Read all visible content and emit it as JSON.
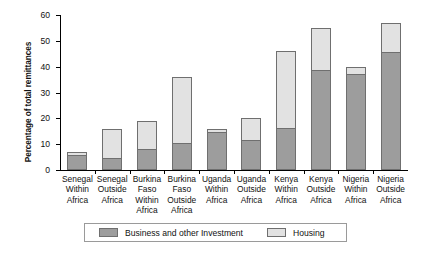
{
  "chart_data": {
    "type": "bar",
    "subtype": "stacked-bar",
    "title": "",
    "xlabel": "",
    "ylabel": "Percentage of total remittances",
    "ylim": [
      0,
      60
    ],
    "yticks": [
      0,
      10,
      20,
      30,
      40,
      50,
      60
    ],
    "grid": false,
    "legend_position": "bottom",
    "categories": [
      "Senegal Within Africa",
      "Senegal Outside Africa",
      "Burkina Faso Within Africa",
      "Burkina Faso Outside Africa",
      "Uganda Within Africa",
      "Uganda Outside Africa",
      "Kenya Within Africa",
      "Kenya Outside Africa",
      "Nigeria Within Africa",
      "Nigeria Outside Africa"
    ],
    "category_lines": [
      [
        "Senegal",
        "Within",
        "Africa"
      ],
      [
        "Senegal",
        "Outside",
        "Africa"
      ],
      [
        "Burkina",
        "Faso",
        "Within",
        "Africa"
      ],
      [
        "Burkina",
        "Faso",
        "Outside",
        "Africa"
      ],
      [
        "Uganda",
        "Within",
        "Africa"
      ],
      [
        "Uganda",
        "Outside",
        "Africa"
      ],
      [
        "Kenya",
        "Within",
        "Africa"
      ],
      [
        "Kenya",
        "Outside",
        "Africa"
      ],
      [
        "Nigeria",
        "Within",
        "Africa"
      ],
      [
        "Nigeria",
        "Outside",
        "Africa"
      ]
    ],
    "series": [
      {
        "name": "Business and other Investment",
        "color": "#9d9d9d",
        "values": [
          5.8,
          4.6,
          8.0,
          10.4,
          14.6,
          11.6,
          16.2,
          38.8,
          37.2,
          45.8
        ]
      },
      {
        "name": "Housing",
        "color": "#e2e2e2",
        "values": [
          1.2,
          11.4,
          11.0,
          25.6,
          1.4,
          8.4,
          29.8,
          16.2,
          2.8,
          11.2
        ]
      }
    ],
    "totals": [
      7.0,
      16.0,
      19.0,
      36.0,
      16.0,
      20.0,
      46.0,
      55.0,
      40.0,
      57.0
    ]
  },
  "legend": {
    "items": [
      {
        "label": "Business and other Investment",
        "color": "#9d9d9d"
      },
      {
        "label": "Housing",
        "color": "#e2e2e2"
      }
    ]
  }
}
